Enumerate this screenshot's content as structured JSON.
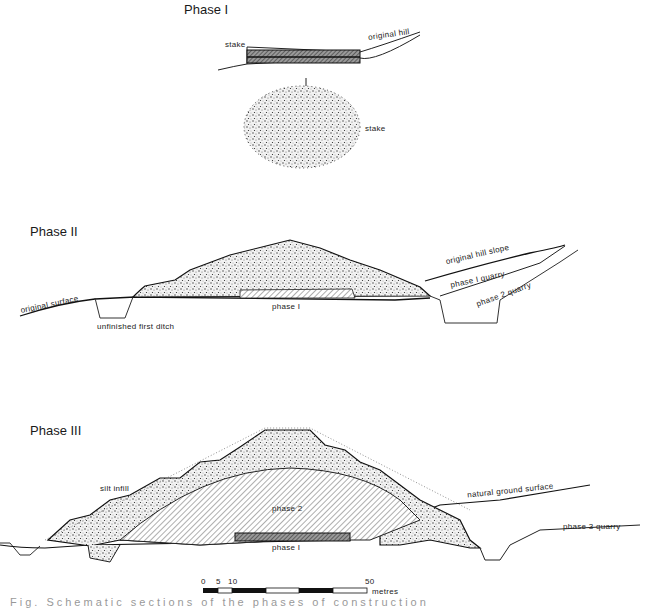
{
  "figure": {
    "phase1": {
      "heading": "Phase I",
      "labels": {
        "stake_top": "stake",
        "original_hill": "original hill",
        "stake_plan": "stake",
        "marker": "I"
      }
    },
    "phase2": {
      "heading": "Phase II",
      "labels": {
        "original_surface": "original surface",
        "unfinished_first_ditch": "unfinished first ditch",
        "phase1": "phase I",
        "original_hill_slope": "original hill slope",
        "phase1_quarry": "phase I quarry",
        "phase2_quarry": "phase 2 quarry"
      }
    },
    "phase3": {
      "heading": "Phase III",
      "labels": {
        "silt_infill": "silt infill",
        "phase2": "phase 2",
        "phase1": "phase I",
        "natural_ground_surface": "natural ground surface",
        "phase3_quarry": "phase 3 quarry"
      }
    },
    "scale_bar": {
      "ticks": [
        "0",
        "5",
        "10",
        "50"
      ],
      "unit": "metres"
    },
    "caption_truncated": "Fig. Schematic sections of the phases of construction"
  }
}
